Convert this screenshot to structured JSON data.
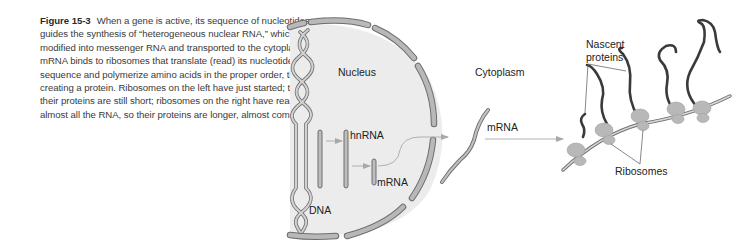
{
  "figure": {
    "label": "Figure 15-3",
    "caption": "When a gene is active, its sequence of nucleotides guides the synthesis of “heterogeneous nuclear RNA,” which is modified into messenger RNA and transported to the cytoplasm. mRNA binds to ribosomes that translate (read) its nucleotide sequence and polymerize amino acids in the proper order, thus creating a protein. Ribosomes on the left have just started; thus, their proteins are still short; ribosomes on the right have read almost all the RNA, so their proteins are longer, almost complete."
  },
  "diagram": {
    "labels": {
      "nucleus": "Nucleus",
      "dna": "DNA",
      "hnrna": "hnRNA",
      "mrna_nuclear": "mRNA",
      "cytoplasm": "Cytoplasm",
      "mrna_cytoplasm": "mRNA",
      "nascent_proteins_line1": "Nascent",
      "nascent_proteins_line2": "proteins",
      "ribosomes": "Ribosomes"
    },
    "colors": {
      "nucleus_fill": "#ebebeb",
      "membrane": "#b4b4b4",
      "membrane_edge": "#707070",
      "rna_fill": "#bdbdbd",
      "protein": "#3a3a3a",
      "ribosome": "#b8b8b8",
      "arrow": "#b0b0b0"
    },
    "ribosome_count": 5
  }
}
